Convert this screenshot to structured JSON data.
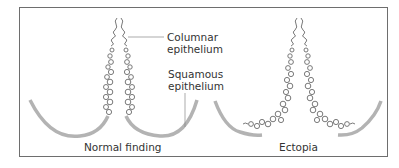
{
  "figure": {
    "panels": [
      {
        "caption": "Normal finding"
      },
      {
        "caption": "Ectopia"
      }
    ],
    "labels": {
      "columnar": {
        "line1": "Columnar",
        "line2": "epithelium"
      },
      "squamous": {
        "line1": "Squamous",
        "line2": "epithelium"
      }
    },
    "colors": {
      "frame": "#6e6e6e",
      "squamous_arc": "#b3b3b3",
      "columnar_coil": "#6a6a6a",
      "text": "#333333"
    }
  }
}
